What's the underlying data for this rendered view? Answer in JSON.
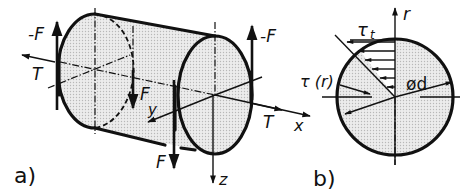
{
  "figure": {
    "panel_a": {
      "tag": "a)",
      "labels": {
        "neg_force_left": "-F",
        "torque_left": "T",
        "force_y_sub_f": "F",
        "force_y_sub_y": "y",
        "force_bottom": "F",
        "neg_force_right": "-F",
        "torque_right": "T",
        "axis_x": "x",
        "axis_z": "z"
      }
    },
    "panel_b": {
      "tag": "b)",
      "labels": {
        "axis_r": "r",
        "tau_t": "τ",
        "tau_t_sub": "t",
        "tau_r": "τ (r)",
        "diameter": "ød"
      }
    },
    "colors": {
      "ink": "#111111",
      "shade": "#d9d9d9",
      "background": "#ffffff"
    }
  }
}
